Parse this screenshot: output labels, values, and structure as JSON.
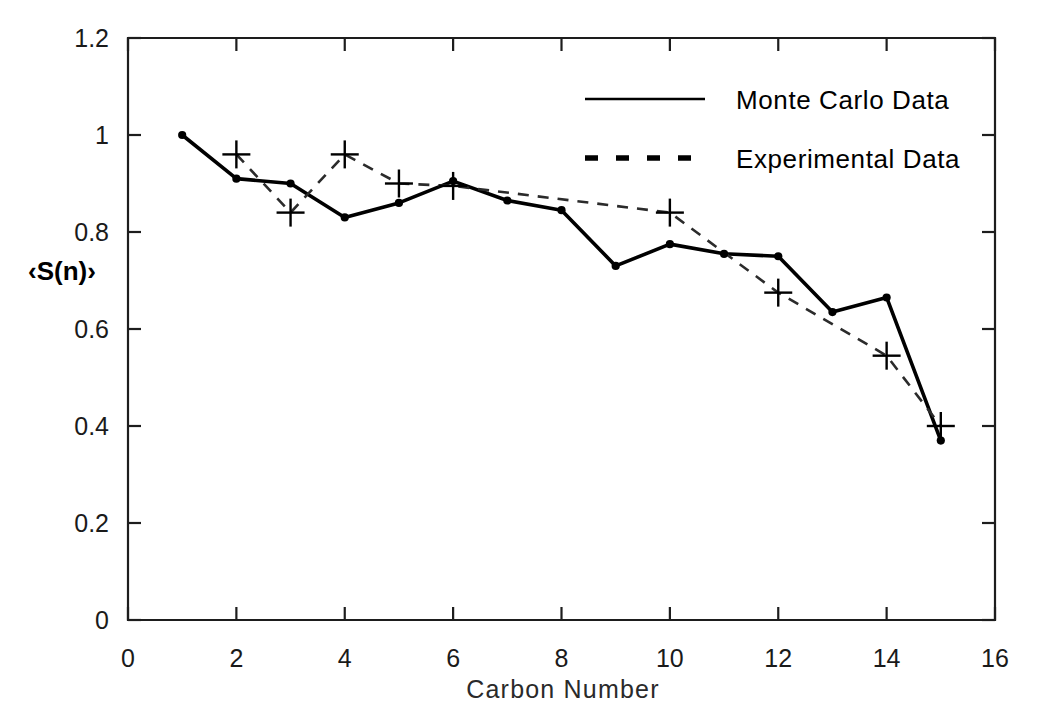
{
  "chart_data": {
    "type": "line",
    "title": "",
    "xlabel": "Carbon Number",
    "ylabel": "‹S(n)›",
    "xlim": [
      0,
      16
    ],
    "ylim": [
      0,
      1.2
    ],
    "xticks": [
      0,
      2,
      4,
      6,
      8,
      10,
      12,
      14,
      16
    ],
    "xtick_labels": [
      "0",
      "2",
      "4",
      "6",
      "8",
      "10",
      "12",
      "14",
      "16"
    ],
    "yticks": [
      0,
      0.2,
      0.4,
      0.6,
      0.8,
      1,
      1.2
    ],
    "ytick_labels": [
      "0",
      "0.2",
      "0.4",
      "0.6",
      "0.8",
      "1",
      "1.2"
    ],
    "grid": false,
    "legend_position": "top-right-inside",
    "series": [
      {
        "name": "Monte Carlo Data",
        "style": "solid",
        "marker": "dot",
        "x": [
          1,
          2,
          3,
          4,
          5,
          6,
          7,
          8,
          9,
          10,
          11,
          12,
          13,
          14,
          15
        ],
        "values": [
          1.0,
          0.91,
          0.9,
          0.83,
          0.86,
          0.905,
          0.865,
          0.845,
          0.73,
          0.775,
          0.755,
          0.75,
          0.635,
          0.665,
          0.37
        ]
      },
      {
        "name": "Experimental Data",
        "style": "dashed",
        "marker": "plus",
        "x": [
          2,
          3,
          4,
          5,
          6,
          10,
          12,
          14,
          15
        ],
        "values": [
          0.96,
          0.84,
          0.96,
          0.9,
          0.895,
          0.84,
          0.675,
          0.545,
          0.4
        ]
      }
    ]
  },
  "legend": {
    "entries": [
      {
        "label": "Monte Carlo Data",
        "style": "solid"
      },
      {
        "label": "Experimental Data",
        "style": "dashed"
      }
    ]
  },
  "axes": {
    "x_title": "Carbon Number",
    "y_title": "‹S(n)›"
  },
  "colors": {
    "background": "#ffffff",
    "foreground": "#000000",
    "axis": "#1d1d1d",
    "dashed_series": "#2b2b2b"
  }
}
